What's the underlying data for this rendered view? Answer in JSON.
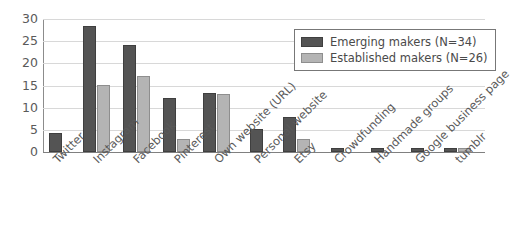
{
  "chart_data": {
    "type": "bar",
    "title": "",
    "subtitle": "",
    "xlabel": "",
    "ylabel": "",
    "ylim": [
      0,
      30
    ],
    "yticks": [
      0,
      5,
      10,
      15,
      20,
      25,
      30
    ],
    "grid": true,
    "legend_position": "upper-right",
    "categories": [
      "Twitter",
      "Instagram",
      "Facebook",
      "Pinterest",
      "Own website (URL)",
      "Personal website",
      "Etsy",
      "Crowdfunding",
      "Handmade groups",
      "Google business page",
      "tumblr"
    ],
    "series": [
      {
        "name": "Emerging makers (N=34)",
        "color": "#545454",
        "values": [
          4.4,
          28.5,
          24.2,
          12.1,
          13.2,
          5.1,
          8.0,
          1.0,
          1.0,
          1.0,
          0.9
        ]
      },
      {
        "name": "Established makers (N=26)",
        "color": "#b4b4b4",
        "values": [
          0,
          15.2,
          17.1,
          3.0,
          13.1,
          0,
          3.0,
          0,
          0,
          0,
          0.8
        ]
      }
    ]
  },
  "legend": {
    "entries": [
      "Emerging makers (N=34)",
      "Established makers (N=26)"
    ]
  },
  "axes": {
    "y_tick_labels": [
      "30",
      "25",
      "20",
      "15",
      "10",
      "5",
      "0"
    ]
  },
  "colors": {
    "series_emerging": "#545454",
    "series_established": "#b4b4b4",
    "gridline": "#d8d8d8",
    "axis": "#808080",
    "text": "#5a5a5a",
    "background": "#ffffff"
  }
}
